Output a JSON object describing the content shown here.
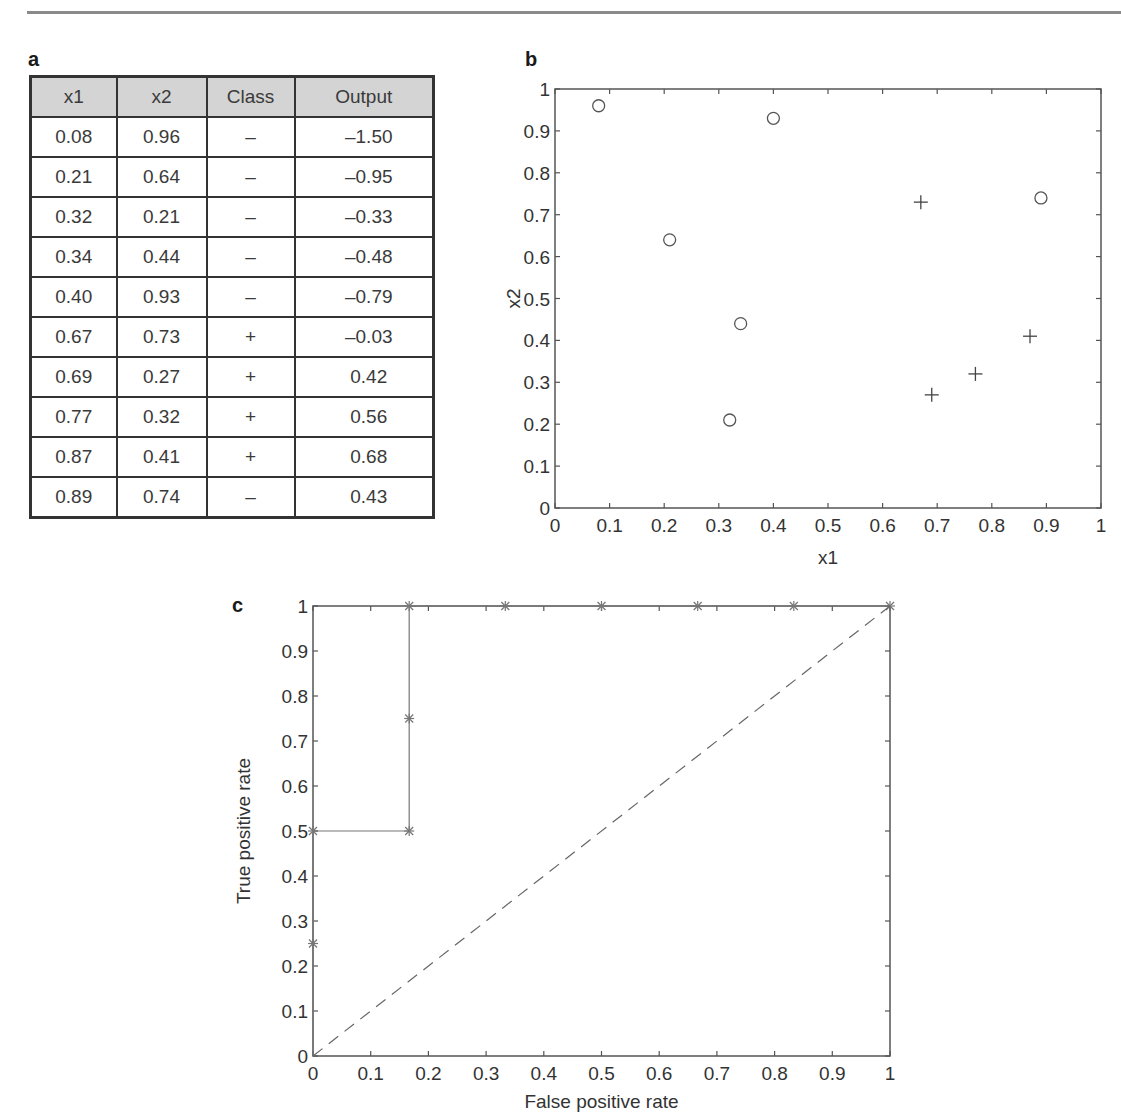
{
  "page": {
    "panel_labels": {
      "a": "a",
      "b": "b",
      "c": "c"
    }
  },
  "table": {
    "headers": [
      "x1",
      "x2",
      "Class",
      "Output"
    ],
    "rows": [
      [
        "0.08",
        "0.96",
        "–",
        "–1.50"
      ],
      [
        "0.21",
        "0.64",
        "–",
        "–0.95"
      ],
      [
        "0.32",
        "0.21",
        "–",
        "–0.33"
      ],
      [
        "0.34",
        "0.44",
        "–",
        "–0.48"
      ],
      [
        "0.40",
        "0.93",
        "–",
        "–0.79"
      ],
      [
        "0.67",
        "0.73",
        "+",
        "–0.03"
      ],
      [
        "0.69",
        "0.27",
        "+",
        "0.42"
      ],
      [
        "0.77",
        "0.32",
        "+",
        "0.56"
      ],
      [
        "0.87",
        "0.41",
        "+",
        "0.68"
      ],
      [
        "0.89",
        "0.74",
        "–",
        "0.43"
      ]
    ]
  },
  "chart_data": [
    {
      "type": "scatter",
      "title": "",
      "xlabel": "x1",
      "ylabel": "x2",
      "xlim": [
        0,
        1
      ],
      "ylim": [
        0,
        1
      ],
      "xticks": [
        "0",
        "0.1",
        "0.2",
        "0.3",
        "0.4",
        "0.5",
        "0.6",
        "0.7",
        "0.8",
        "0.9",
        "1"
      ],
      "yticks": [
        "0",
        "0.1",
        "0.2",
        "0.3",
        "0.4",
        "0.5",
        "0.6",
        "0.7",
        "0.8",
        "0.9",
        "1"
      ],
      "grid": false,
      "series": [
        {
          "name": "negative (o)",
          "marker": "circle",
          "points": [
            [
              0.08,
              0.96
            ],
            [
              0.21,
              0.64
            ],
            [
              0.32,
              0.21
            ],
            [
              0.34,
              0.44
            ],
            [
              0.4,
              0.93
            ],
            [
              0.89,
              0.74
            ]
          ]
        },
        {
          "name": "positive (+)",
          "marker": "plus",
          "points": [
            [
              0.67,
              0.73
            ],
            [
              0.69,
              0.27
            ],
            [
              0.77,
              0.32
            ],
            [
              0.87,
              0.41
            ]
          ]
        }
      ]
    },
    {
      "type": "line",
      "title": "",
      "xlabel": "False positive rate",
      "ylabel": "True positive rate",
      "xlim": [
        0,
        1
      ],
      "ylim": [
        0,
        1
      ],
      "xticks": [
        "0",
        "0.1",
        "0.2",
        "0.3",
        "0.4",
        "0.5",
        "0.6",
        "0.7",
        "0.8",
        "0.9",
        "1"
      ],
      "yticks": [
        "0",
        "0.1",
        "0.2",
        "0.3",
        "0.4",
        "0.5",
        "0.6",
        "0.7",
        "0.8",
        "0.9",
        "1"
      ],
      "grid": false,
      "series": [
        {
          "name": "ROC curve",
          "marker": "asterisk",
          "style": "solid",
          "points": [
            [
              0,
              0
            ],
            [
              0,
              0.25
            ],
            [
              0,
              0.5
            ],
            [
              0.1667,
              0.5
            ],
            [
              0.1667,
              0.75
            ],
            [
              0.1667,
              1
            ],
            [
              0.3333,
              1
            ],
            [
              0.5,
              1
            ],
            [
              0.6667,
              1
            ],
            [
              0.8333,
              1
            ],
            [
              1,
              1
            ]
          ]
        },
        {
          "name": "random baseline",
          "marker": "none",
          "style": "dashed",
          "points": [
            [
              0,
              0
            ],
            [
              1,
              1
            ]
          ]
        }
      ]
    }
  ]
}
